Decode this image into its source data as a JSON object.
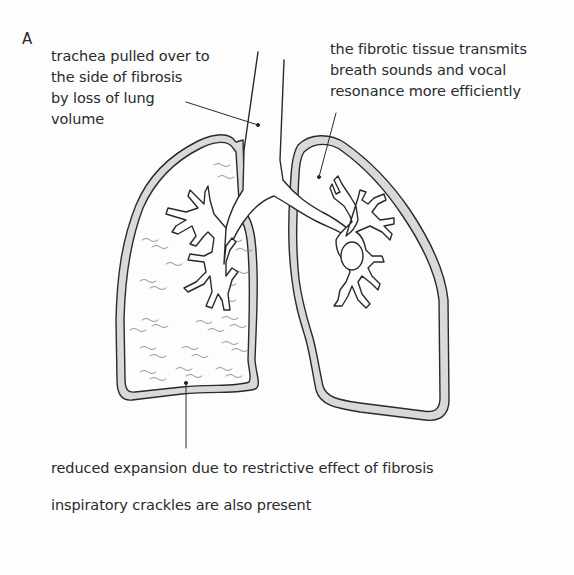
{
  "figure": {
    "panel_letter": "A"
  },
  "annotations": {
    "trachea": {
      "lines": [
        "trachea pulled over to",
        "the side of fibrosis",
        "by loss of lung",
        "volume"
      ]
    },
    "fibrotic_tissue": {
      "lines": [
        "the fibrotic tissue transmits",
        "breath sounds and vocal",
        "resonance more efficiently"
      ]
    },
    "reduced_expansion": {
      "text": "reduced expansion due to restrictive effect of fibrosis"
    },
    "crackles": {
      "text": "inspiratory crackles are also present"
    }
  },
  "colors": {
    "background": "#fdfdfd",
    "outline": "#2a2a2a",
    "pleura_fill": "#d9d9d9",
    "crackle_marks": "#8a8a8a"
  }
}
